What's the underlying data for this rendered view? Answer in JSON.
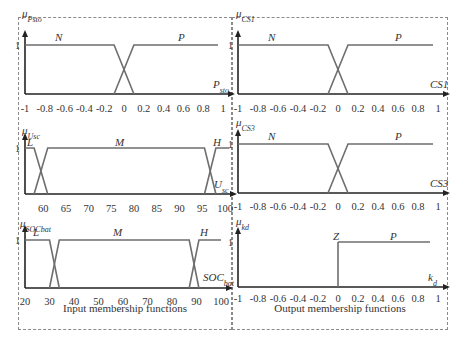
{
  "colors": {
    "curve": "#6e6e6e",
    "axis": "#222222",
    "text": "#333333",
    "border": "#8a8a8a"
  },
  "panels": {
    "input": {
      "caption": "Input membership functions"
    },
    "output": {
      "caption": "Output membership functions"
    }
  },
  "chart_data": [
    {
      "type": "line",
      "id": "Psto",
      "ylabel": "μ_Psto",
      "xlabel": "P_sto",
      "ytick": "1",
      "xticks": [
        "-1",
        "-0.8",
        "-0.6",
        "-0.4",
        "-0.2",
        "0",
        "0.2",
        "0.4",
        "0.6",
        "0.8",
        "1"
      ],
      "xlim": [
        -1,
        1
      ],
      "ylim": [
        0,
        1
      ],
      "series": [
        {
          "name": "N",
          "points": [
            [
              -1,
              1
            ],
            [
              -0.1,
              1
            ],
            [
              0.1,
              0
            ]
          ]
        },
        {
          "name": "P",
          "points": [
            [
              -0.1,
              0
            ],
            [
              0.1,
              1
            ],
            [
              0.95,
              1
            ]
          ]
        }
      ]
    },
    {
      "type": "line",
      "id": "CS1",
      "ylabel": "μ_CS1",
      "xlabel": "CS1",
      "ytick": "1",
      "xticks": [
        "-1",
        "-0.8",
        "-0.6",
        "-0.4",
        "-0.2",
        "0",
        "0.2",
        "0.4",
        "0.6",
        "0.8",
        "1"
      ],
      "xlim": [
        -1,
        1
      ],
      "ylim": [
        0,
        1
      ],
      "series": [
        {
          "name": "N",
          "points": [
            [
              -1,
              1
            ],
            [
              -0.1,
              1
            ],
            [
              0.1,
              0
            ]
          ]
        },
        {
          "name": "P",
          "points": [
            [
              -0.1,
              0
            ],
            [
              0.1,
              1
            ],
            [
              0.95,
              1
            ]
          ]
        }
      ]
    },
    {
      "type": "line",
      "id": "Usc",
      "ylabel": "μ_Usc",
      "xlabel": "U_sc",
      "ytick": "1",
      "xticks": [
        "60",
        "65",
        "70",
        "75",
        "80",
        "85",
        "90",
        "95",
        "100"
      ],
      "xlim": [
        56,
        100
      ],
      "ylim": [
        0,
        1
      ],
      "series": [
        {
          "name": "L",
          "points": [
            [
              56,
              1
            ],
            [
              58,
              1
            ],
            [
              61,
              0
            ]
          ]
        },
        {
          "name": "M",
          "points": [
            [
              58,
              0
            ],
            [
              61,
              1
            ],
            [
              95.5,
              1
            ],
            [
              98,
              0
            ]
          ]
        },
        {
          "name": "H",
          "points": [
            [
              95.5,
              0
            ],
            [
              98,
              1
            ],
            [
              101,
              1
            ]
          ]
        }
      ]
    },
    {
      "type": "line",
      "id": "CS3",
      "ylabel": "μ_CS3",
      "xlabel": "CS3",
      "ytick": "1",
      "xticks": [
        "-1",
        "-0.8",
        "-0.6",
        "-0.4",
        "-0.2",
        "0",
        "0.2",
        "0.4",
        "0.6",
        "0.8",
        "1"
      ],
      "xlim": [
        -1,
        1
      ],
      "ylim": [
        0,
        1
      ],
      "series": [
        {
          "name": "N",
          "points": [
            [
              -1,
              1
            ],
            [
              -0.1,
              1
            ],
            [
              0.1,
              0
            ]
          ]
        },
        {
          "name": "P",
          "points": [
            [
              -0.1,
              0
            ],
            [
              0.1,
              1
            ],
            [
              0.95,
              1
            ]
          ]
        }
      ]
    },
    {
      "type": "line",
      "id": "SOCbat",
      "ylabel": "μ_SOCbat",
      "xlabel": "SOC_bat",
      "ytick": "1",
      "xticks": [
        "20",
        "30",
        "40",
        "50",
        "60",
        "70",
        "80",
        "90",
        "100"
      ],
      "xlim": [
        20,
        100
      ],
      "ylim": [
        0,
        1
      ],
      "series": [
        {
          "name": "L",
          "points": [
            [
              20,
              1
            ],
            [
              30,
              1
            ],
            [
              34,
              0
            ]
          ]
        },
        {
          "name": "M",
          "points": [
            [
              30,
              0
            ],
            [
              34,
              1
            ],
            [
              87,
              1
            ],
            [
              91,
              0
            ]
          ]
        },
        {
          "name": "H",
          "points": [
            [
              87,
              0
            ],
            [
              91,
              1
            ],
            [
              100,
              1
            ]
          ]
        }
      ]
    },
    {
      "type": "line",
      "id": "kd",
      "ylabel": "μ_kd",
      "xlabel": "k_d",
      "ytick": "1",
      "xticks": [
        "-1",
        "-0.8",
        "-0.6",
        "-0.4",
        "-0.2",
        "0",
        "0.2",
        "0.4",
        "0.6",
        "0.8",
        "1"
      ],
      "xlim": [
        -1,
        1
      ],
      "ylim": [
        0,
        1
      ],
      "series": [
        {
          "name": "Z",
          "points": [
            [
              0,
              0
            ],
            [
              0,
              1
            ]
          ]
        },
        {
          "name": "P",
          "points": [
            [
              0,
              1
            ],
            [
              0.92,
              1
            ]
          ]
        }
      ]
    }
  ]
}
